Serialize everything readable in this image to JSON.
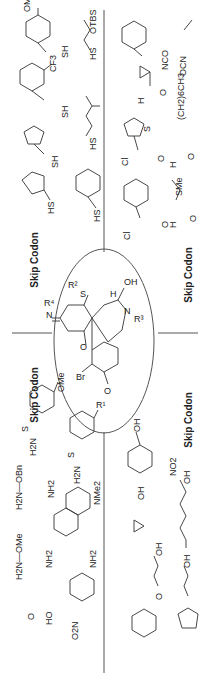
{
  "skip_codon_label": "Skip Codon",
  "core": {
    "labels": [
      "R²",
      "S",
      "OH",
      "H",
      "N",
      "R³",
      "R⁴",
      "N",
      "O",
      "Br",
      "O",
      "R¹"
    ]
  },
  "quadrants": {
    "thiols": {
      "position": "top-left",
      "items": [
        "4-methoxybenzyl mercaptan (OMe, SH)",
        "3-(trifluoromethyl)benzyl mercaptan (CF3, SH)",
        "furfuryl mercaptan (SH)",
        "cyclopentanethiol (HS)",
        "2-(TBS-oxy)ethanethiol (HS, OTBS)",
        "3-methylbutanethiol (HS)",
        "2-phenylethanethiol (HS)"
      ],
      "texts": [
        "OMe",
        "SH",
        "CF3",
        "SH",
        "SH",
        "HS",
        "OTBS",
        "HS",
        "HS",
        "HS"
      ]
    },
    "acylating": {
      "position": "top-right",
      "items": [
        "benzyl isocyanate (NCO)",
        "ethyl isocyanate (OCN)",
        "cyclopropanecarboxaldehyde",
        "octanal (CH2)6CH3",
        "thiophene-2-carbonyl chloride",
        "3-(methylthio)propanal (SMe)",
        "benzoyl chloride"
      ],
      "texts": [
        "NCO",
        "OCN",
        "H",
        "O",
        "(CH2)6CH3",
        "Cl",
        "O",
        "S",
        "H",
        "O",
        "SMe",
        "Cl",
        "O"
      ]
    },
    "hydrazines": {
      "position": "bottom-left",
      "items": [
        "4-methoxybenzenesulfonyl hydrazide",
        "tosyl hydrazide",
        "O-benzylhydroxylamine",
        "dansyl hydrazide",
        "O-methylhydroxylamine",
        "(aminooxy)acetic acid",
        "4-nitrophenylhydrazine"
      ],
      "texts": [
        "OMe",
        "H2N",
        "N",
        "H",
        "H2N",
        "N",
        "H",
        "H2N—OBn",
        "NH2",
        "NMe2",
        "H2N—OMe",
        "NH2",
        "HO",
        "O",
        "NH2",
        "O2N",
        "N",
        "H"
      ]
    },
    "alcohols": {
      "position": "bottom-right",
      "items": [
        "3-nitrobenzyl alcohol",
        "hex-5-en-1-ol",
        "cyclopropylmethanol",
        "3-phenoxypropan-1-ol",
        "3-cyclopentylpropan-1-ol"
      ],
      "texts": [
        "OH",
        "NO2",
        "OH",
        "OH",
        "OH",
        "OH"
      ]
    }
  }
}
